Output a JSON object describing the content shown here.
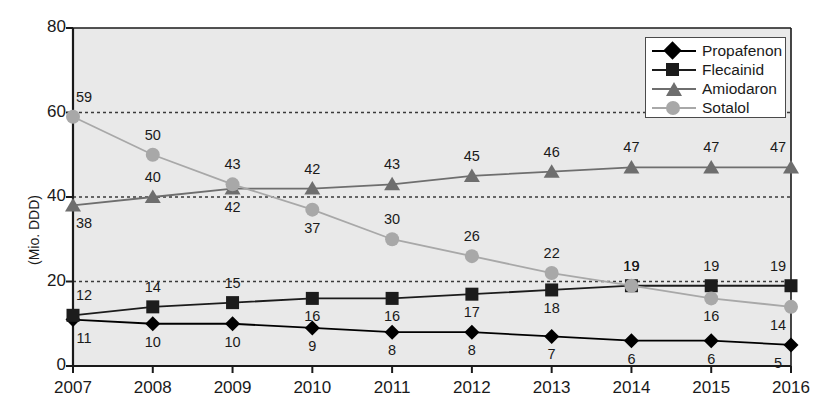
{
  "chart_data": {
    "type": "line",
    "title": "",
    "xlabel": "",
    "ylabel": "(Mio. DDD)",
    "categories": [
      "2007",
      "2008",
      "2009",
      "2010",
      "2011",
      "2012",
      "2013",
      "2014",
      "2015",
      "2016"
    ],
    "xticklabels": [
      "2007",
      "2008",
      "2009",
      "2010",
      "2011",
      "2012",
      "2013",
      "2014",
      "2015",
      "2016"
    ],
    "yticklabels": [
      "0",
      "20",
      "40",
      "60",
      "80"
    ],
    "yticks": [
      0,
      20,
      40,
      60,
      80
    ],
    "ylim": [
      0,
      80
    ],
    "grid": "horizontal dashed at 20, 40, 60",
    "legend_position": "top-right inside plot",
    "series": [
      {
        "name": "Propafenon",
        "marker": "diamond",
        "color": "#000000",
        "values": [
          11,
          10,
          10,
          9,
          8,
          8,
          7,
          6,
          6,
          5
        ],
        "label_side": [
          "below",
          "below",
          "below",
          "below",
          "below",
          "below",
          "below",
          "below",
          "below",
          "below"
        ]
      },
      {
        "name": "Flecainid",
        "marker": "square",
        "color": "#1c1c1c",
        "values": [
          12,
          14,
          15,
          16,
          16,
          17,
          18,
          19,
          19,
          19
        ],
        "label_side": [
          "above",
          "above",
          "above",
          "below",
          "below",
          "below",
          "below",
          "above",
          "above",
          "above"
        ]
      },
      {
        "name": "Amiodaron",
        "marker": "triangle",
        "color": "#6e6e6e",
        "values": [
          38,
          40,
          42,
          42,
          43,
          45,
          46,
          47,
          47,
          47
        ],
        "label_side": [
          "below",
          "above",
          "below",
          "above",
          "above",
          "above",
          "above",
          "above",
          "above",
          "above"
        ]
      },
      {
        "name": "Sotalol",
        "marker": "circle",
        "color": "#a8a8a8",
        "values": [
          59,
          50,
          43,
          37,
          30,
          26,
          22,
          19,
          16,
          14
        ],
        "label_side": [
          "above",
          "above",
          "above",
          "below",
          "above",
          "above",
          "above",
          "above",
          "below",
          "below"
        ]
      }
    ]
  },
  "legend": {
    "items": [
      {
        "label": "Propafenon",
        "marker": "diamond-marker"
      },
      {
        "label": "Flecainid",
        "marker": "square-marker"
      },
      {
        "label": "Amiodaron",
        "marker": "triangle-marker"
      },
      {
        "label": "Sotalol",
        "marker": "circle-marker"
      }
    ]
  },
  "colors": {
    "plot_background": "#e9e9e9",
    "axis": "#1a1a1a",
    "propafenon": "#000000",
    "flecainid": "#1c1c1c",
    "amiodaron": "#6e6e6e",
    "sotalol": "#a8a8a8"
  }
}
